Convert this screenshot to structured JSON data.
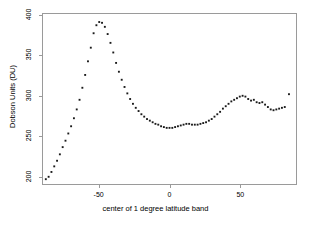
{
  "chart_data": {
    "type": "scatter",
    "title": "",
    "xlabel": "center of 1 degree latitude band",
    "ylabel": "Dobson Units (DU)",
    "xlim": [
      -90,
      90
    ],
    "ylim": [
      190,
      402
    ],
    "xticks": [
      -50,
      0,
      50
    ],
    "xtick_labels": [
      "-50",
      "0",
      "50"
    ],
    "yticks": [
      200,
      250,
      300,
      350,
      400
    ],
    "ytick_labels": [
      "200",
      "250",
      "300",
      "350",
      "400"
    ],
    "grid": false,
    "legend": "none",
    "marker": "square",
    "marker_color": "#1a1a1a",
    "marker_size": 1.9,
    "series": [
      {
        "name": "total column ozone",
        "x": [
          -88,
          -86,
          -84,
          -82,
          -80,
          -78,
          -76,
          -74,
          -72,
          -70,
          -68,
          -66,
          -64,
          -62,
          -60,
          -58,
          -56,
          -54,
          -52,
          -50,
          -48,
          -46,
          -44,
          -42,
          -40,
          -38,
          -36,
          -34,
          -32,
          -30,
          -28,
          -26,
          -24,
          -22,
          -20,
          -18,
          -16,
          -14,
          -12,
          -10,
          -8,
          -6,
          -4,
          -2,
          0,
          2,
          4,
          6,
          8,
          10,
          12,
          14,
          16,
          18,
          20,
          22,
          24,
          26,
          28,
          30,
          32,
          34,
          36,
          38,
          40,
          42,
          44,
          46,
          48,
          50,
          52,
          54,
          56,
          58,
          60,
          62,
          64,
          66,
          68,
          70,
          72,
          74,
          76,
          78,
          80,
          82,
          85
        ],
        "y": [
          196,
          199,
          205,
          212,
          219,
          227,
          236,
          244,
          253,
          262,
          272,
          283,
          295,
          310,
          326,
          343,
          360,
          378,
          388,
          392,
          391,
          386,
          377,
          366,
          354,
          341,
          330,
          320,
          311,
          303,
          296,
          290,
          285,
          281,
          277,
          274,
          271,
          269,
          267,
          265,
          264,
          262,
          261,
          260,
          260,
          260,
          261,
          262,
          263,
          264,
          265,
          265,
          264,
          264,
          264,
          265,
          266,
          267,
          269,
          271,
          274,
          277,
          280,
          284,
          287,
          290,
          293,
          295,
          297,
          299,
          300,
          299,
          296,
          294,
          295,
          292,
          291,
          292,
          289,
          286,
          283,
          282,
          283,
          284,
          285,
          286,
          302
        ]
      }
    ]
  }
}
